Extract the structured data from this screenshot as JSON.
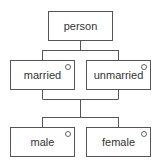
{
  "diagram": {
    "type": "tree",
    "nodes": [
      {
        "id": "person",
        "label": "person",
        "has_circle": false
      },
      {
        "id": "married",
        "label": "married",
        "has_circle": true
      },
      {
        "id": "unmarried",
        "label": "unmarried",
        "has_circle": true
      },
      {
        "id": "male",
        "label": "male",
        "has_circle": true
      },
      {
        "id": "female",
        "label": "female",
        "has_circle": true
      }
    ],
    "edges": [
      {
        "from": "person",
        "to": "married"
      },
      {
        "from": "person",
        "to": "unmarried"
      },
      {
        "from": "married",
        "to": "male"
      },
      {
        "from": "married",
        "to": "female"
      },
      {
        "from": "unmarried",
        "to": "male"
      },
      {
        "from": "unmarried",
        "to": "female"
      }
    ],
    "colors": {
      "line": "#555555",
      "text": "#333333",
      "background": "#ffffff"
    }
  }
}
